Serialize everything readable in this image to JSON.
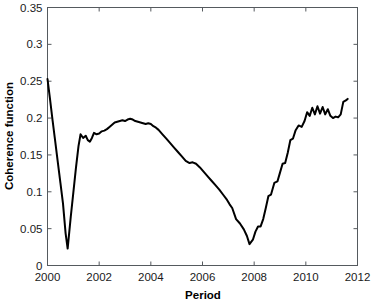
{
  "chart_data": {
    "type": "line",
    "title": "",
    "xlabel": "Period",
    "ylabel": "Coherence function",
    "xlim": [
      2000,
      2012
    ],
    "ylim": [
      0,
      0.35
    ],
    "grid": false,
    "legend": null,
    "xticks": [
      2000,
      2002,
      2004,
      2006,
      2008,
      2010,
      2012
    ],
    "xtick_labels": [
      "2000",
      "2002",
      "2004",
      "2006",
      "2008",
      "2010",
      "2012"
    ],
    "yticks": [
      0,
      0.05,
      0.1,
      0.15,
      0.2,
      0.25,
      0.3,
      0.35
    ],
    "ytick_labels": [
      "0",
      "0.05",
      "0.1",
      "0.15",
      "0.2",
      "0.25",
      "0.3",
      "0.35"
    ],
    "line_color": "#000000",
    "series": [
      {
        "name": "Coherence function",
        "x": [
          2000.0,
          2000.1,
          2000.2,
          2000.3,
          2000.4,
          2000.5,
          2000.6,
          2000.7,
          2000.78,
          2000.9,
          2001.0,
          2001.1,
          2001.2,
          2001.28,
          2001.38,
          2001.48,
          2001.56,
          2001.64,
          2001.72,
          2001.8,
          2001.9,
          2002.0,
          2002.1,
          2002.2,
          2002.3,
          2002.4,
          2002.5,
          2002.6,
          2002.7,
          2002.8,
          2002.9,
          2003.0,
          2003.1,
          2003.2,
          2003.3,
          2003.4,
          2003.5,
          2003.6,
          2003.7,
          2003.8,
          2003.9,
          2004.0,
          2004.1,
          2004.2,
          2004.3,
          2004.45,
          2004.6,
          2004.75,
          2004.9,
          2005.05,
          2005.2,
          2005.35,
          2005.5,
          2005.62,
          2005.75,
          2005.9,
          2006.05,
          2006.2,
          2006.35,
          2006.5,
          2006.65,
          2006.8,
          2006.95,
          2007.05,
          2007.15,
          2007.3,
          2007.45,
          2007.6,
          2007.72,
          2007.82,
          2007.95,
          2008.05,
          2008.15,
          2008.25,
          2008.35,
          2008.45,
          2008.55,
          2008.65,
          2008.78,
          2008.9,
          2009.0,
          2009.1,
          2009.2,
          2009.3,
          2009.4,
          2009.5,
          2009.6,
          2009.72,
          2009.84,
          2009.95,
          2010.05,
          2010.15,
          2010.25,
          2010.35,
          2010.45,
          2010.55,
          2010.65,
          2010.75,
          2010.85,
          2010.95,
          2011.05,
          2011.15,
          2011.25,
          2011.35,
          2011.45,
          2011.55,
          2011.62
        ],
        "y": [
          0.253,
          0.225,
          0.196,
          0.168,
          0.14,
          0.112,
          0.084,
          0.044,
          0.023,
          0.066,
          0.099,
          0.132,
          0.162,
          0.178,
          0.173,
          0.176,
          0.17,
          0.168,
          0.173,
          0.18,
          0.178,
          0.179,
          0.182,
          0.183,
          0.185,
          0.188,
          0.191,
          0.194,
          0.195,
          0.196,
          0.197,
          0.196,
          0.198,
          0.199,
          0.198,
          0.196,
          0.195,
          0.194,
          0.193,
          0.192,
          0.193,
          0.192,
          0.189,
          0.187,
          0.184,
          0.178,
          0.172,
          0.166,
          0.16,
          0.154,
          0.148,
          0.142,
          0.139,
          0.14,
          0.138,
          0.133,
          0.127,
          0.121,
          0.115,
          0.109,
          0.103,
          0.096,
          0.089,
          0.083,
          0.078,
          0.063,
          0.057,
          0.049,
          0.04,
          0.029,
          0.035,
          0.046,
          0.053,
          0.053,
          0.063,
          0.078,
          0.094,
          0.096,
          0.112,
          0.114,
          0.126,
          0.138,
          0.139,
          0.153,
          0.17,
          0.172,
          0.183,
          0.19,
          0.188,
          0.196,
          0.208,
          0.203,
          0.214,
          0.205,
          0.216,
          0.206,
          0.215,
          0.205,
          0.212,
          0.203,
          0.2,
          0.202,
          0.201,
          0.205,
          0.222,
          0.224,
          0.226
        ]
      }
    ]
  }
}
